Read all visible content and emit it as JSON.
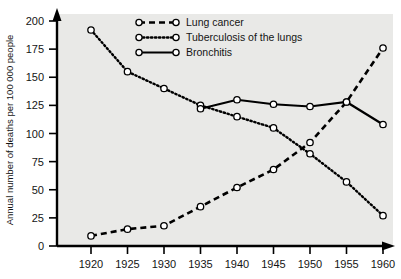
{
  "chart_data": {
    "type": "line",
    "title": "",
    "xlabel": "",
    "ylabel": "Annual number of deaths per 100 000 people",
    "x": [
      1920,
      1925,
      1930,
      1935,
      1940,
      1945,
      1950,
      1955,
      1960
    ],
    "xticklabels": [
      "1920",
      "1925",
      "1930",
      "1935",
      "1940",
      "1945",
      "1950",
      "1955",
      "1960"
    ],
    "yticklabels": [
      "0",
      "25",
      "50",
      "75",
      "100",
      "125",
      "150",
      "175",
      "200"
    ],
    "yticks": [
      0,
      25,
      50,
      75,
      100,
      125,
      150,
      175,
      200
    ],
    "ylim": [
      0,
      200
    ],
    "xlim": [
      1917.5,
      1962.5
    ],
    "grid": false,
    "legend_position": "top-right",
    "series": [
      {
        "name": "Lung cancer",
        "style": "dashed",
        "marker": "open-circle",
        "values": [
          9,
          15,
          18,
          35,
          52,
          68,
          92,
          128,
          176
        ]
      },
      {
        "name": "Tuberculosis of the lungs",
        "style": "dotted",
        "marker": "open-circle",
        "values": [
          192,
          155,
          140,
          125,
          115,
          105,
          82,
          57,
          27
        ]
      },
      {
        "name": "Bronchitis",
        "style": "solid",
        "marker": "open-circle",
        "values": [
          null,
          null,
          null,
          122,
          130,
          126,
          124,
          128,
          108
        ]
      }
    ]
  },
  "legend": {
    "items": [
      {
        "label": "Lung cancer",
        "style": "dashed"
      },
      {
        "label": "Tuberculosis of the lungs",
        "style": "dotted"
      },
      {
        "label": "Bronchitis",
        "style": "solid"
      }
    ]
  },
  "axes": {
    "y_title": "Annual number of deaths per 100 000 people"
  },
  "colors": {
    "plot_background": "#e9e9e7",
    "page_background": "#ffffff",
    "ink": "#000000",
    "marker_fill": "#ffffff"
  }
}
